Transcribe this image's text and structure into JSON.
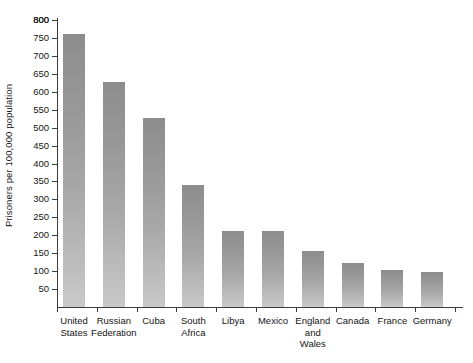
{
  "chart_data": {
    "type": "bar",
    "title": "",
    "xlabel": "",
    "ylabel": "Prisoners per 100,000 population",
    "ylim": [
      0,
      800
    ],
    "grid": false,
    "legend": "none",
    "yticks": [
      50,
      100,
      150,
      200,
      250,
      300,
      350,
      400,
      450,
      500,
      550,
      600,
      650,
      700,
      750,
      800
    ],
    "categories": [
      "United States",
      "Russian Federation",
      "Cuba",
      "South Africa",
      "Libya",
      "Mexico",
      "England and Wales",
      "Canada",
      "France",
      "Germany"
    ],
    "category_lines": [
      [
        "United",
        "States"
      ],
      [
        "Russian",
        "Federation"
      ],
      [
        "Cuba"
      ],
      [
        "South",
        "Africa"
      ],
      [
        "Libya"
      ],
      [
        "Mexico"
      ],
      [
        "England",
        "and",
        "Wales"
      ],
      [
        "Canada"
      ],
      [
        "France"
      ],
      [
        "Germany"
      ]
    ],
    "values": [
      760,
      628,
      528,
      340,
      212,
      212,
      157,
      122,
      103,
      97
    ],
    "bar_color_top": "#8d8d8d",
    "bar_color_bottom": "#c9c9c9",
    "axis_color": "#3c3c3c",
    "background": "#ffffff"
  },
  "axis": {
    "y_title": "Prisoners per 100,000 population",
    "tick_labels": [
      "800",
      "750",
      "700",
      "650",
      "600",
      "550",
      "500",
      "450",
      "400",
      "350",
      "300",
      "250",
      "200",
      "150",
      "100",
      "50"
    ]
  }
}
